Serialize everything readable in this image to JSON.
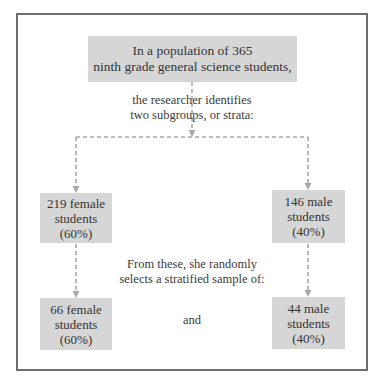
{
  "diagram": {
    "type": "flowchart",
    "population_box": {
      "line1": "In a population of 365",
      "line2": "ninth grade general science students,"
    },
    "identify_text": {
      "line1": "the researcher identifies",
      "line2": "two subgroups, or strata:"
    },
    "strata": [
      {
        "line1": "219 female",
        "line2": "students",
        "line3": "(60%)"
      },
      {
        "line1": "146 male",
        "line2": "students",
        "line3": "(40%)"
      }
    ],
    "sample_text": {
      "line1": "From these, she randomly",
      "line2": "selects a stratified sample of:"
    },
    "samples": [
      {
        "line1": "66 female",
        "line2": "students",
        "line3": "(60%)"
      },
      {
        "line1": "44 male",
        "line2": "students",
        "line3": "(40%)"
      }
    ],
    "connector_text": "and",
    "colors": {
      "box_fill": "#d6d6d6",
      "frame_border": "#6e6e6e",
      "dashed_line": "#a8a8a8",
      "text": "#333333"
    }
  }
}
